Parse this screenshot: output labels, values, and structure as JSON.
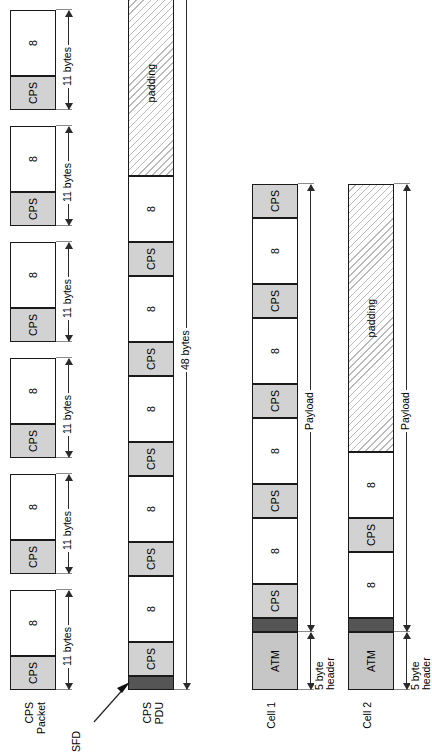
{
  "figure": {
    "colors": {
      "cps_fill": "#d2d2d2",
      "atm_fill": "#c6c6c6",
      "sfd_fill": "#555555",
      "padding_hatch": "#b9b9b9",
      "outline": "#1a1a1a"
    }
  },
  "rows": [
    {
      "id": "cps-packet",
      "label": "CPS\nPacket",
      "segments": [
        {
          "kind": "cps",
          "text": "CPS"
        },
        {
          "kind": "payload",
          "text": "8"
        }
      ],
      "repeat": 6,
      "dimension": {
        "text": "11 bytes"
      }
    },
    {
      "id": "cps-pdu",
      "label": "CPS\nPDU",
      "segments": [
        {
          "kind": "sfd",
          "text": ""
        },
        {
          "kind": "cps",
          "text": "CPS"
        },
        {
          "kind": "payload",
          "text": "8"
        },
        {
          "kind": "cps",
          "text": "CPS"
        },
        {
          "kind": "payload",
          "text": "8"
        },
        {
          "kind": "cps",
          "text": "CPS"
        },
        {
          "kind": "payload",
          "text": "8"
        },
        {
          "kind": "cps",
          "text": "CPS"
        },
        {
          "kind": "payload",
          "text": "8"
        },
        {
          "kind": "cps",
          "text": "CPS"
        },
        {
          "kind": "payload",
          "text": "8"
        },
        {
          "kind": "padding",
          "text": "padding"
        }
      ],
      "dimension": {
        "text": "48 bytes"
      },
      "callout": {
        "text": "SFD"
      }
    },
    {
      "id": "cell-1",
      "label": "Cell 1",
      "segments": [
        {
          "kind": "atm",
          "text": "ATM"
        },
        {
          "kind": "sfd",
          "text": ""
        },
        {
          "kind": "cps",
          "text": "CPS"
        },
        {
          "kind": "payload",
          "text": "8"
        },
        {
          "kind": "cps",
          "text": "CPS"
        },
        {
          "kind": "payload",
          "text": "8"
        },
        {
          "kind": "cps",
          "text": "CPS"
        },
        {
          "kind": "payload",
          "text": "8"
        },
        {
          "kind": "cps",
          "text": "CPS"
        },
        {
          "kind": "payload",
          "text": "8"
        },
        {
          "kind": "cps",
          "text": "CPS"
        }
      ],
      "header_dimension": {
        "text": "5 byte\nheader"
      },
      "payload_dimension": {
        "text": "Payload"
      }
    },
    {
      "id": "cell-2",
      "label": "Cell 2",
      "segments": [
        {
          "kind": "atm",
          "text": "ATM"
        },
        {
          "kind": "sfd",
          "text": ""
        },
        {
          "kind": "payload",
          "text": "8"
        },
        {
          "kind": "cps",
          "text": "CPS"
        },
        {
          "kind": "payload",
          "text": "8"
        },
        {
          "kind": "padding",
          "text": "padding"
        }
      ],
      "header_dimension": {
        "text": "5 byte\nheader"
      },
      "payload_dimension": {
        "text": "Payload"
      }
    }
  ],
  "icons": {
    "phone": "telephone-handset-icon",
    "arrow": "arrow-icon"
  }
}
